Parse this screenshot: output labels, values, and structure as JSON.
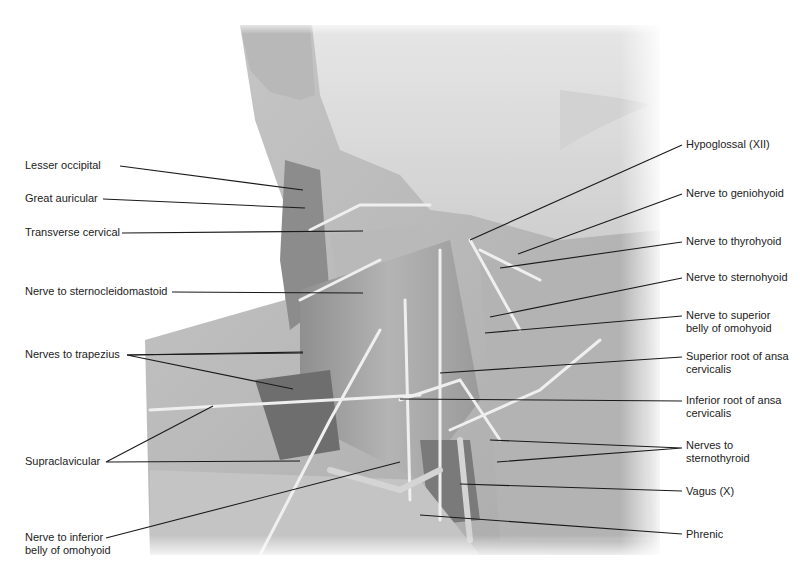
{
  "figure": {
    "type": "anatomical-dissection-photo",
    "labels_left": [
      {
        "id": "lesser-occipital",
        "text": "Lesser occipital",
        "y": 165
      },
      {
        "id": "great-auricular",
        "text": "Great auricular",
        "y": 198
      },
      {
        "id": "transverse-cervical",
        "text": "Transverse cervical",
        "y": 232
      },
      {
        "id": "nerve-to-sternocleidomastoid",
        "text": "Nerve to sternocleidomastoid",
        "y": 291
      },
      {
        "id": "nerves-to-trapezius",
        "text": "Nerves to trapezius",
        "y": 354
      },
      {
        "id": "supraclavicular",
        "text": "Supraclavicular",
        "y": 461
      },
      {
        "id": "nerve-to-inferior-belly-of-omohyoid",
        "line1": "Nerve to inferior",
        "line2": "belly of omohyoid",
        "y": 538
      }
    ],
    "labels_right": [
      {
        "id": "hypoglossal",
        "text": "Hypoglossal (XII)",
        "y": 144
      },
      {
        "id": "nerve-to-geniohyoid",
        "text": "Nerve to geniohyoid",
        "y": 193
      },
      {
        "id": "nerve-to-thyrohyoid",
        "text": "Nerve to thyrohyoid",
        "y": 241
      },
      {
        "id": "nerve-to-sternohyoid",
        "text": "Nerve to sternohyoid",
        "y": 277
      },
      {
        "id": "nerve-to-superior-belly-of-omohyoid",
        "line1": "Nerve to superior",
        "line2": "belly of omohyoid",
        "y": 314
      },
      {
        "id": "superior-root-of-ansa-cervicalis",
        "line1": "Superior root of ansa",
        "line2": "cervicalis",
        "y": 357
      },
      {
        "id": "inferior-root-of-ansa-cervicalis",
        "line1": "Inferior root of ansa",
        "line2": "cervicalis",
        "y": 401
      },
      {
        "id": "nerves-to-sternothyroid",
        "line1": "Nerves to",
        "line2": "sternothyroid",
        "y": 446
      },
      {
        "id": "vagus",
        "text": "Vagus (X)",
        "y": 491
      },
      {
        "id": "phrenic",
        "text": "Phrenic",
        "y": 534
      }
    ]
  }
}
